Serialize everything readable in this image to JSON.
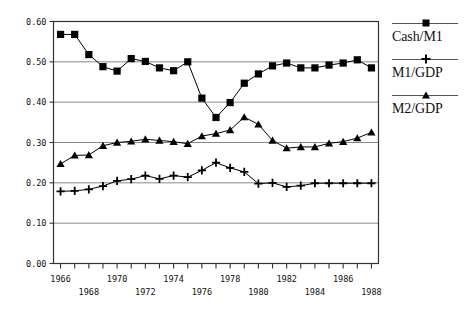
{
  "chart_data": {
    "type": "line",
    "title": "",
    "xlabel": "",
    "ylabel": "",
    "xlim": [
      1965.5,
      1988.5
    ],
    "ylim": [
      0.0,
      0.6
    ],
    "grid": true,
    "legend_position": "right",
    "y_ticks": [
      "0.00",
      "0.10",
      "0.20",
      "0.30",
      "0.40",
      "0.50",
      "0.60"
    ],
    "y_tick_values": [
      0.0,
      0.1,
      0.2,
      0.3,
      0.4,
      0.5,
      0.6
    ],
    "x_ticks_upper": [
      "1966",
      "1970",
      "1974",
      "1978",
      "1982",
      "1986"
    ],
    "x_ticks_lower": [
      "1968",
      "1972",
      "1976",
      "1980",
      "1984",
      "1988"
    ],
    "x_tick_values": [
      1966,
      1968,
      1970,
      1972,
      1974,
      1976,
      1978,
      1980,
      1982,
      1984,
      1986,
      1988
    ],
    "x": [
      1966,
      1967,
      1968,
      1969,
      1970,
      1971,
      1972,
      1973,
      1974,
      1975,
      1976,
      1977,
      1978,
      1979,
      1980,
      1981,
      1982,
      1983,
      1984,
      1985,
      1986,
      1987,
      1988
    ],
    "series": [
      {
        "name": "Cash/M1",
        "marker": "square",
        "color": "#000000",
        "values": [
          0.568,
          0.568,
          0.518,
          0.488,
          0.477,
          0.508,
          0.501,
          0.485,
          0.478,
          0.5,
          0.41,
          0.362,
          0.399,
          0.447,
          0.47,
          0.49,
          0.497,
          0.485,
          0.485,
          0.492,
          0.497,
          0.505,
          0.485
        ]
      },
      {
        "name": "M1/GDP",
        "marker": "plus",
        "color": "#000000",
        "values": [
          0.179,
          0.18,
          0.184,
          0.192,
          0.205,
          0.209,
          0.218,
          0.21,
          0.218,
          0.214,
          0.231,
          0.25,
          0.237,
          0.227,
          0.198,
          0.2,
          0.19,
          0.193,
          0.199,
          0.199,
          0.199,
          0.199,
          0.199
        ]
      },
      {
        "name": "M2/GDP",
        "marker": "triangle",
        "color": "#000000",
        "values": [
          0.247,
          0.268,
          0.269,
          0.292,
          0.3,
          0.303,
          0.308,
          0.305,
          0.302,
          0.297,
          0.316,
          0.322,
          0.331,
          0.363,
          0.345,
          0.305,
          0.286,
          0.289,
          0.289,
          0.298,
          0.302,
          0.311,
          0.325
        ]
      }
    ]
  },
  "legend": {
    "entries": [
      {
        "label": "Cash/M1",
        "marker": "square-marker-icon"
      },
      {
        "label": "M1/GDP",
        "marker": "plus-marker-icon"
      },
      {
        "label": "M2/GDP",
        "marker": "triangle-marker-icon"
      }
    ]
  }
}
